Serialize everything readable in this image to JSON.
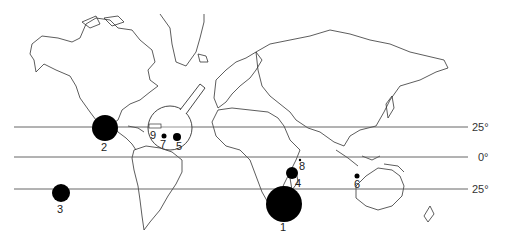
{
  "map": {
    "type": "world-outline-map",
    "projection": "equirectangular-like",
    "latitude_lines": [
      {
        "label": "25°",
        "y": 127
      },
      {
        "label": "0°",
        "y": 157
      },
      {
        "label": "25°",
        "y": 189
      }
    ],
    "inset": {
      "label": "caribbean-magnifier",
      "cx": 170,
      "cy": 128,
      "r": 22
    },
    "sites": [
      {
        "id": "1",
        "label": "1",
        "cx": 284,
        "cy": 204,
        "r": 18,
        "lx": 284,
        "ly": 231
      },
      {
        "id": "2",
        "label": "2",
        "cx": 105,
        "cy": 128,
        "r": 13,
        "lx": 105,
        "ly": 151
      },
      {
        "id": "3",
        "label": "3",
        "cx": 61,
        "cy": 193,
        "r": 9,
        "lx": 61,
        "ly": 213
      },
      {
        "id": "4",
        "label": "4",
        "cx": 292,
        "cy": 173,
        "r": 6,
        "lx": 298,
        "ly": 187
      },
      {
        "id": "5",
        "label": "5",
        "cx": 177,
        "cy": 137,
        "r": 4,
        "lx": 180,
        "ly": 150
      },
      {
        "id": "6",
        "label": "6",
        "cx": 357,
        "cy": 176,
        "r": 2.5,
        "lx": 358,
        "ly": 187
      },
      {
        "id": "7",
        "label": "7",
        "cx": 164,
        "cy": 136,
        "r": 2.5,
        "lx": 163,
        "ly": 148
      },
      {
        "id": "8",
        "label": "8",
        "cx": 300,
        "cy": 160,
        "r": 1.2,
        "lx": 302,
        "ly": 170
      },
      {
        "id": "9",
        "label": "9",
        "cx": 154,
        "cy": 127,
        "r": 0,
        "lx": 154,
        "ly": 138
      }
    ]
  }
}
